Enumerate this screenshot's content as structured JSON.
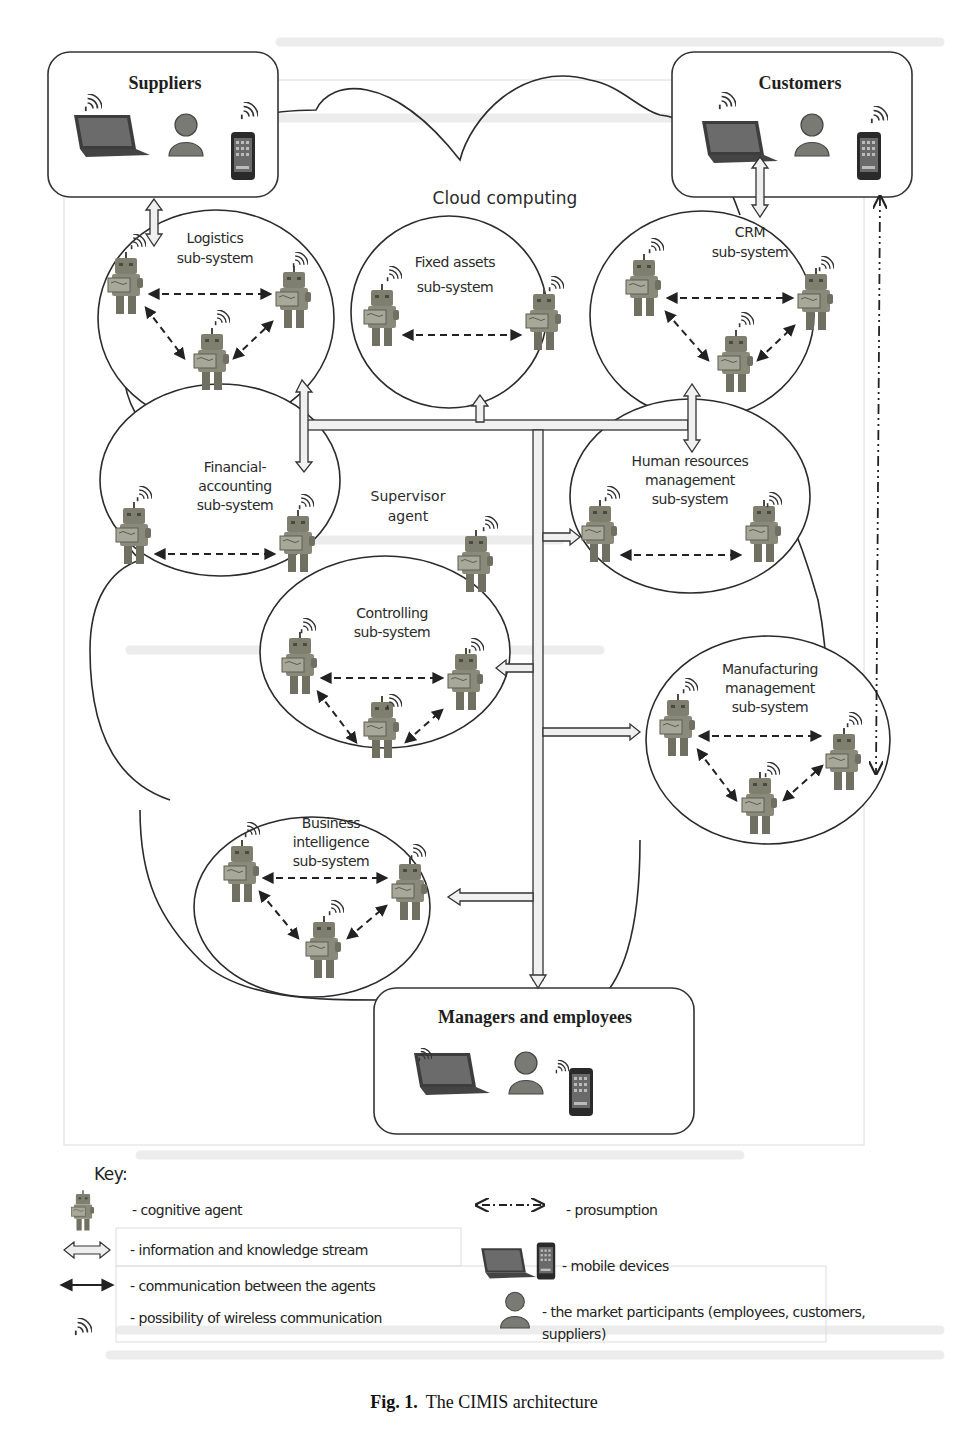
{
  "figure": {
    "caption_number": "Fig. 1.",
    "caption_text": "The CIMIS architecture",
    "cloud_label": "Cloud computing",
    "supervisor_label_line1": "Supervisor",
    "supervisor_label_line2": "agent"
  },
  "market_boxes": {
    "suppliers": {
      "title": "Suppliers"
    },
    "customers": {
      "title": "Customers"
    },
    "managers": {
      "title": "Managers and employees"
    }
  },
  "subsystems": [
    {
      "id": "logistics",
      "line1": "Logistics",
      "line2": "sub-system",
      "line3": "",
      "agents": 3
    },
    {
      "id": "fixed-assets",
      "line1": "Fixed assets",
      "line2": "sub-system",
      "line3": "",
      "agents": 2
    },
    {
      "id": "crm",
      "line1": "CRM",
      "line2": "sub-system",
      "line3": "",
      "agents": 3
    },
    {
      "id": "financial-accounting",
      "line1": "Financial-",
      "line2": "accounting",
      "line3": "sub-system",
      "agents": 2
    },
    {
      "id": "human-resources",
      "line1": "Human resources",
      "line2": "management",
      "line3": "sub-system",
      "agents": 2
    },
    {
      "id": "controlling",
      "line1": "Controlling",
      "line2": "sub-system",
      "line3": "",
      "agents": 3
    },
    {
      "id": "manufacturing",
      "line1": "Manufacturing",
      "line2": "management",
      "line3": "sub-system",
      "agents": 3
    },
    {
      "id": "business-intelligence",
      "line1": "Business",
      "line2": "intelligence",
      "line3": "sub-system",
      "agents": 3
    }
  ],
  "key": {
    "title": "Key:",
    "items": [
      {
        "icon": "robot-icon",
        "label": "- cognitive agent"
      },
      {
        "icon": "double-hollow-arrow-icon",
        "label": "- information and knowledge stream"
      },
      {
        "icon": "double-arrow-icon",
        "label": "- communication between the agents"
      },
      {
        "icon": "wifi-icon",
        "label": "- possibility of wireless communication"
      },
      {
        "icon": "dash-dot-arrow-icon",
        "label": "- prosumption"
      },
      {
        "icon": "laptop-phone-icon",
        "label": "- mobile devices"
      },
      {
        "icon": "person-icon",
        "label": "- the market participants (employees, customers,",
        "label2": "suppliers)"
      }
    ]
  },
  "colors": {
    "line": "#2b2b2b",
    "robot_body": "#8a8a7a",
    "robot_dark": "#5d5d52",
    "person": "#7c7c76",
    "device_screen": "#3a3a3a",
    "stream_fill": "#ececec",
    "faint_text": "#e4e4e4"
  }
}
